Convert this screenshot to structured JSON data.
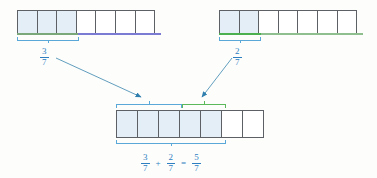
{
  "figure": {
    "denominator": 7,
    "colors": {
      "shade": "#e3eef6",
      "cell_border": "#5d6166",
      "label_blue": "#2d7fc1",
      "bracket_blue": "#5aa8d8",
      "bracket_green": "#5bb85b",
      "underline_purple": "#7b7bd4",
      "underline_green": "#4caf50",
      "arrow": "#2f7fae"
    }
  },
  "models": [
    {
      "id": "addend-1",
      "name": "first-addend-bar",
      "total_cells": 7,
      "shaded_cells": 3,
      "label": {
        "numerator": "3",
        "denominator": "7"
      },
      "underline_color_key": "underline_purple",
      "underline_from_cell": 4,
      "underline_to_cell": 7
    },
    {
      "id": "addend-2",
      "name": "second-addend-bar",
      "total_cells": 7,
      "shaded_cells": 2,
      "label": {
        "numerator": "2",
        "denominator": "7"
      },
      "underline_color_key": "underline_green",
      "underline_from_cell": 1,
      "underline_to_cell": 2
    },
    {
      "id": "sum",
      "name": "sum-bar",
      "total_cells": 7,
      "shaded_cells": 5,
      "label": null
    }
  ],
  "sum_brackets": [
    {
      "name": "sum-bracket-first-part",
      "cells": 3,
      "color_key": "bracket_blue"
    },
    {
      "name": "sum-bracket-second-part",
      "cells": 2,
      "color_key": "bracket_green"
    }
  ],
  "equation": {
    "term1": {
      "numerator": "3",
      "denominator": "7"
    },
    "plus": "+",
    "term2": {
      "numerator": "2",
      "denominator": "7"
    },
    "equals": "=",
    "result": {
      "numerator": "5",
      "denominator": "7"
    },
    "text": "3/7 + 2/7 = 5/7"
  },
  "arrows": [
    {
      "name": "arrow-from-first-addend",
      "from": "3/7 label",
      "to": "sum bar first part"
    },
    {
      "name": "arrow-from-second-addend",
      "from": "2/7 label",
      "to": "sum bar second part"
    }
  ]
}
